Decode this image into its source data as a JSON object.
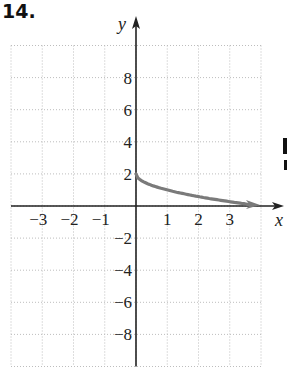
{
  "problem": {
    "number": "14."
  },
  "chart_data": {
    "type": "line",
    "title": "",
    "xlabel": "x",
    "ylabel": "y",
    "xlim": [
      -4,
      4
    ],
    "ylim": [
      -10,
      10
    ],
    "grid": true,
    "grid_style": "dotted",
    "x_ticks": [
      -3,
      -2,
      -1,
      1,
      2,
      3
    ],
    "x_tick_labels": [
      "−3",
      "−2",
      "−1",
      "1",
      "2",
      "3"
    ],
    "y_ticks": [
      8,
      6,
      4,
      2,
      -2,
      -4,
      -6,
      -8
    ],
    "y_tick_labels": [
      "8",
      "6",
      "4",
      "2",
      "−2",
      "−4",
      "−6",
      "−8"
    ],
    "series": [
      {
        "name": "curve",
        "description": "starts at (0,2) decreasing to x-axis near (4,0), arrow at right end",
        "x": [
          0,
          0.25,
          1,
          2,
          3,
          4
        ],
        "y": [
          2,
          1.5,
          1,
          0.59,
          0.27,
          0
        ],
        "color": "#7a7a7a",
        "end_arrow": true
      }
    ],
    "colors": {
      "axis": "#222222",
      "grid": "#bdbdbd",
      "curve": "#7a7a7a"
    }
  }
}
